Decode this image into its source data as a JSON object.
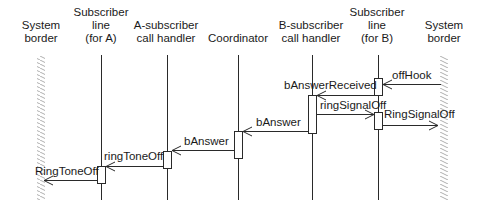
{
  "diagram": {
    "type": "sequence",
    "participants": [
      {
        "id": "sys-left",
        "lines": [
          "System",
          "border"
        ],
        "kind": "boundary"
      },
      {
        "id": "sub-a",
        "lines": [
          "Subscriber",
          "line",
          "(for A)"
        ],
        "kind": "lifeline"
      },
      {
        "id": "a-handler",
        "lines": [
          "A-subscriber",
          "call handler"
        ],
        "kind": "lifeline"
      },
      {
        "id": "coordinator",
        "lines": [
          "Coordinator"
        ],
        "kind": "lifeline"
      },
      {
        "id": "b-handler",
        "lines": [
          "B-subscriber",
          "call handler"
        ],
        "kind": "lifeline"
      },
      {
        "id": "sub-b",
        "lines": [
          "Subscriber",
          "line",
          "(for B)"
        ],
        "kind": "lifeline"
      },
      {
        "id": "sys-right",
        "lines": [
          "System",
          "border"
        ],
        "kind": "boundary"
      }
    ],
    "messages": [
      {
        "label": "offHook",
        "from": "sys-right",
        "to": "sub-b"
      },
      {
        "label": "bAnswerReceived",
        "from": "sub-b",
        "to": "b-handler"
      },
      {
        "label": "ringSignalOff",
        "from": "b-handler",
        "to": "sub-b"
      },
      {
        "label": "RingSignalOff",
        "from": "sub-b",
        "to": "sys-right"
      },
      {
        "label": "bAnswer",
        "from": "b-handler",
        "to": "coordinator"
      },
      {
        "label": "bAnswer",
        "from": "coordinator",
        "to": "a-handler"
      },
      {
        "label": "ringToneOff",
        "from": "a-handler",
        "to": "sub-a"
      },
      {
        "label": "RingToneOff",
        "from": "sub-a",
        "to": "sys-left"
      }
    ]
  }
}
